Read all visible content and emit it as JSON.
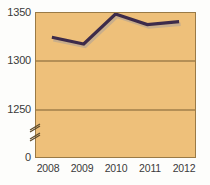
{
  "chart_data": {
    "type": "line",
    "title": "",
    "subtitle": "",
    "xlabel": "",
    "ylabel": "",
    "categories": [
      "2008",
      "2009",
      "2010",
      "2011",
      "2012"
    ],
    "values": [
      1325,
      1318,
      1349,
      1338,
      1341
    ],
    "series": [
      {
        "name": "series-1",
        "values": [
          1325,
          1318,
          1349,
          1338,
          1341
        ],
        "color": "#3d2b4a"
      }
    ],
    "ylim": [
      0,
      1350
    ],
    "y_ticks": [
      "0",
      "1250",
      "1300",
      "1350"
    ],
    "y_gridline_values": [
      1250,
      1300,
      1350
    ],
    "x_ticks": [
      "2008",
      "2009",
      "2010",
      "2011",
      "2012"
    ],
    "axis_break": true,
    "axis_break_between": [
      0,
      1250
    ],
    "grid": true,
    "legend": "none",
    "plot_background_color": "#eec07a",
    "line_color": "#3d2b4a",
    "shadow_color": "#c9ae8a",
    "axis_color": "#7a5f33",
    "text_color": "#3a3a3a"
  },
  "axis": {
    "y_tick_1350": "1350",
    "y_tick_1300": "1300",
    "y_tick_1250": "1250",
    "y_tick_0": "0",
    "x_tick_2008": "2008",
    "x_tick_2009": "2009",
    "x_tick_2010": "2010",
    "x_tick_2011": "2011",
    "x_tick_2012": "2012"
  }
}
